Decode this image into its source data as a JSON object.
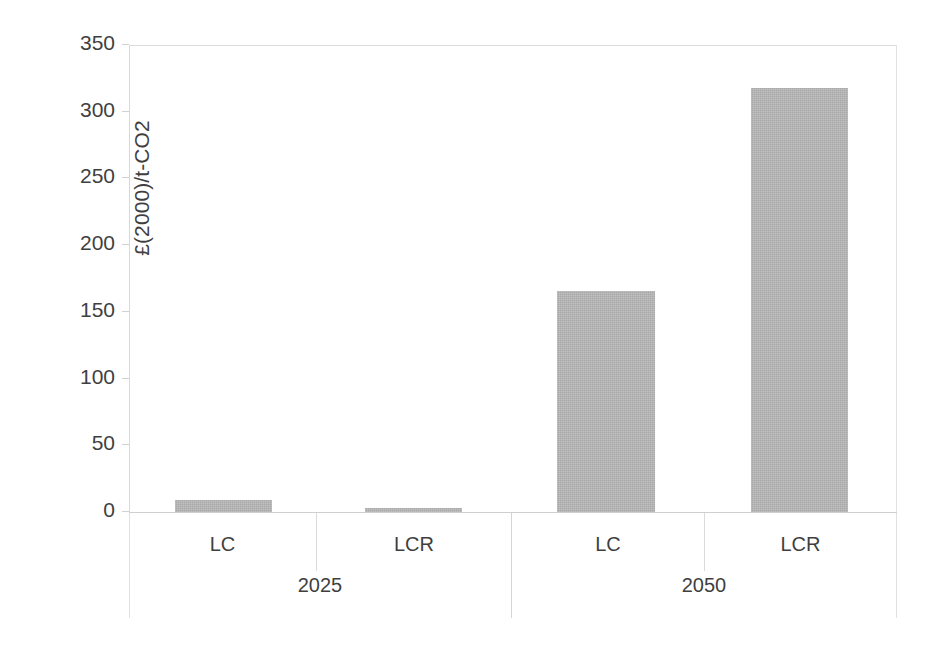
{
  "chart_data": {
    "type": "bar",
    "title": "",
    "subtitle": "",
    "xlabel": "",
    "ylabel": "£(2000)/t-CO2",
    "ylim": [
      0,
      350
    ],
    "ytick_values": [
      0,
      50,
      100,
      150,
      200,
      250,
      300,
      350
    ],
    "ytick_labels": [
      "0",
      "50",
      "100",
      "150",
      "200",
      "250",
      "300",
      "350"
    ],
    "grid": false,
    "legend": "none",
    "categories": [
      "LC",
      "LCR",
      "LC",
      "LCR"
    ],
    "groups": [
      {
        "label": "2025",
        "categories": [
          "LC",
          "LCR"
        ],
        "values": [
          9,
          3
        ]
      },
      {
        "label": "2050",
        "categories": [
          "LC",
          "LCR"
        ],
        "values": [
          166,
          318
        ]
      }
    ],
    "values": [
      9,
      3,
      166,
      318
    ],
    "series": [
      {
        "name": "carbon price",
        "values": [
          9,
          3,
          166,
          318
        ]
      }
    ],
    "bar_color": "#b3b3b3",
    "axis_color": "#d8d8d8",
    "text_color": "#3f3f3f"
  },
  "axis": {
    "y_title": "£(2000)/t-CO2",
    "ticks": [
      {
        "value": 350,
        "label": "350"
      },
      {
        "value": 300,
        "label": "300"
      },
      {
        "value": 250,
        "label": "250"
      },
      {
        "value": 200,
        "label": "200"
      },
      {
        "value": 150,
        "label": "150"
      },
      {
        "value": 100,
        "label": "100"
      },
      {
        "value": 50,
        "label": "50"
      },
      {
        "value": 0,
        "label": "0"
      }
    ]
  },
  "x_axis": {
    "categories": [
      {
        "label": "LC"
      },
      {
        "label": "LCR"
      },
      {
        "label": "LC"
      },
      {
        "label": "LCR"
      }
    ],
    "groups": [
      {
        "label": "2025"
      },
      {
        "label": "2050"
      }
    ]
  },
  "bars": [
    {
      "name": "bar-2025-lc",
      "label": "LC",
      "group": "2025",
      "value": 9
    },
    {
      "name": "bar-2025-lcr",
      "label": "LCR",
      "group": "2025",
      "value": 3
    },
    {
      "name": "bar-2050-lc",
      "label": "LC",
      "group": "2050",
      "value": 166
    },
    {
      "name": "bar-2050-lcr",
      "label": "LCR",
      "group": "2050",
      "value": 318
    }
  ]
}
